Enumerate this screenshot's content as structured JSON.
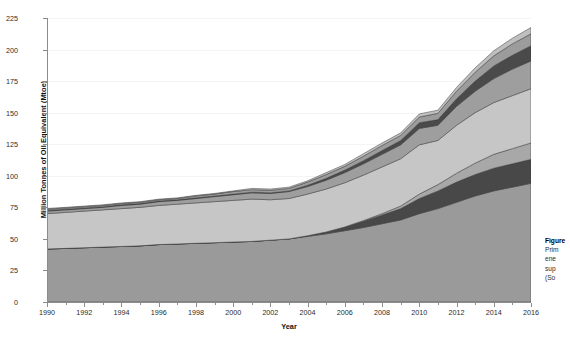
{
  "chart_data": {
    "type": "area",
    "title": "",
    "xlabel": "Year",
    "ylabel": "Million Tonnes of Oil Equivalent (Mtoe)",
    "stacked": true,
    "grid": true,
    "legend_position": "none",
    "xlim": [
      1990,
      2016
    ],
    "ylim": [
      0,
      225
    ],
    "ytick_step": 25,
    "xtick_step": 2,
    "yticks": [
      "0",
      "25",
      "50",
      "75",
      "100",
      "125",
      "150",
      "175",
      "200",
      "225"
    ],
    "xticks": [
      "1990",
      "1992",
      "1994",
      "1996",
      "1998",
      "2000",
      "2002",
      "2004",
      "2006",
      "2008",
      "2010",
      "2012",
      "2014",
      "2016"
    ],
    "x": [
      1990,
      1991,
      1992,
      1993,
      1994,
      1995,
      1996,
      1997,
      1998,
      1999,
      2000,
      2001,
      2002,
      2003,
      2004,
      2005,
      2006,
      2007,
      2008,
      2009,
      2010,
      2011,
      2012,
      2013,
      2014,
      2015,
      2016
    ],
    "series": [
      {
        "name": "series-1-bottom-medium-gray",
        "color": "#9a9a9a",
        "values": [
          42,
          42.5,
          43,
          43.5,
          44,
          44.5,
          45.5,
          46,
          46.5,
          47,
          47.5,
          48,
          49,
          50,
          52,
          54,
          56.5,
          59,
          62,
          65,
          70,
          74,
          79,
          84,
          88,
          91,
          94
        ]
      },
      {
        "name": "series-2-dark-band",
        "color": "#484848",
        "values": [
          0,
          0,
          0,
          0,
          0,
          0,
          0,
          0,
          0,
          0,
          0,
          0,
          0,
          0,
          0.5,
          1.5,
          3,
          5,
          7,
          9,
          12,
          14,
          16,
          17,
          18,
          18.5,
          19
        ]
      },
      {
        "name": "series-3-medium-gray",
        "color": "#a8a8a8",
        "values": [
          0,
          0,
          0,
          0,
          0,
          0,
          0,
          0,
          0,
          0,
          0,
          0,
          0,
          0,
          0,
          0,
          0,
          0.5,
          1,
          2,
          3.5,
          5,
          7,
          9,
          11,
          12,
          13
        ]
      },
      {
        "name": "series-4-light-gray",
        "color": "#c6c6c6",
        "values": [
          28,
          28.5,
          29,
          29.5,
          30,
          30.5,
          31,
          31.5,
          32,
          32.5,
          33,
          33.5,
          32,
          32,
          33,
          34,
          35,
          36,
          37,
          37.5,
          39,
          35,
          38,
          40,
          41,
          42,
          43
        ]
      },
      {
        "name": "series-5-medium-dark-gray",
        "color": "#9e9e9e",
        "values": [
          2,
          2,
          2,
          2,
          2.5,
          2.5,
          3,
          3,
          3.5,
          4,
          4.5,
          5,
          5,
          5.5,
          6,
          7,
          8,
          9,
          10,
          11,
          13,
          12,
          15,
          17,
          19,
          21,
          22
        ]
      },
      {
        "name": "series-6-dark-upper-band",
        "color": "#4a4a4a",
        "values": [
          0.5,
          0.5,
          0.5,
          0.5,
          0.5,
          0.5,
          0.5,
          0.5,
          0.5,
          0.5,
          0.5,
          0.5,
          0.5,
          0.5,
          1,
          1.5,
          2,
          2.5,
          3,
          3.5,
          4.5,
          4.5,
          6,
          8,
          10,
          11,
          12
        ]
      },
      {
        "name": "series-7-top-medium-gray",
        "color": "#9c9c9c",
        "values": [
          1,
          1,
          1,
          1,
          1,
          1,
          1,
          1,
          1.5,
          1.5,
          2,
          2,
          2,
          2,
          2.5,
          3,
          3,
          3.5,
          4,
          4,
          4.5,
          5,
          6,
          7,
          8,
          9,
          9.5
        ]
      },
      {
        "name": "series-8-top-light-sliver",
        "color": "#bfbfbf",
        "values": [
          0.5,
          0.5,
          0.5,
          0.5,
          0.5,
          0.5,
          0.5,
          0.5,
          0.5,
          0.5,
          0.5,
          1,
          1,
          1,
          1,
          1.5,
          1.5,
          2,
          2,
          2,
          2.5,
          2.5,
          3,
          3.5,
          4,
          4.5,
          5
        ]
      }
    ],
    "totals": [
      74,
      75,
      76,
      77,
      78.5,
      79.5,
      81.5,
      82.5,
      84.5,
      87,
      88,
      90,
      89.5,
      91,
      96,
      102.5,
      109,
      117.5,
      126,
      134.5,
      149,
      152.5,
      170,
      185.5,
      199,
      209,
      217.5
    ]
  },
  "caption": {
    "line1": "Figure",
    "line2": "Prim",
    "line3": "ene",
    "line4": "sup",
    "line5": "(So"
  }
}
